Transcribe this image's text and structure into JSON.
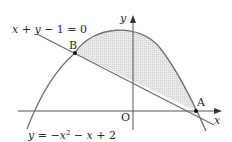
{
  "diagram": {
    "line_equation": "x + y − 1 = 0",
    "parabola_equation_prefix": "y = −x",
    "parabola_equation_exp": "2",
    "parabola_equation_suffix": " − x + 2",
    "point_a": "A",
    "point_b": "B",
    "origin": "O",
    "x_axis_label": "x",
    "y_axis_label": "y",
    "colors": {
      "curve": "#6f6f6f",
      "axis": "#555555",
      "shade": "#e6e6e6",
      "point": "#111111"
    }
  }
}
